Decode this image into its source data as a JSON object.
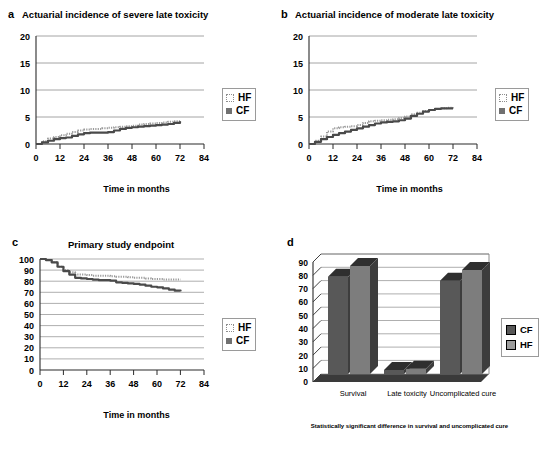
{
  "figure": {
    "panels": [
      "a",
      "b",
      "c",
      "d"
    ]
  },
  "panel_a": {
    "letter": "a",
    "title": "Actuarial incidence of severe late toxicity",
    "xlabel": "Time in months",
    "legend": [
      {
        "label": "HF",
        "marker": "dotted-square"
      },
      {
        "label": "CF",
        "marker": "filled-dot"
      }
    ]
  },
  "panel_b": {
    "letter": "b",
    "title": "Actuarial incidence of moderate late toxicity",
    "xlabel": "Time in months",
    "legend": [
      {
        "label": "HF",
        "marker": "dotted-square"
      },
      {
        "label": "CF",
        "marker": "filled-dot"
      }
    ]
  },
  "panel_c": {
    "letter": "c",
    "title": "Primary study endpoint",
    "xlabel": "Time in months",
    "legend": [
      {
        "label": "HF",
        "marker": "dotted-square"
      },
      {
        "label": "CF",
        "marker": "filled-dot"
      }
    ]
  },
  "panel_d": {
    "letter": "d",
    "caption": "Statistically significant difference in survival and uncomplicated cure",
    "legend": [
      {
        "label": "CF",
        "color": "#585858"
      },
      {
        "label": "HF",
        "color": "#7d7d7d"
      }
    ]
  },
  "chart_data": [
    {
      "type": "line",
      "panel": "a",
      "title": "Actuarial incidence of severe late toxicity",
      "xlabel": "Time in months",
      "ylabel": "",
      "xlim": [
        0,
        84
      ],
      "ylim": [
        0,
        20
      ],
      "xticks": [
        0,
        12,
        24,
        36,
        48,
        60,
        72,
        84
      ],
      "yticks": [
        0,
        5,
        10,
        15,
        20
      ],
      "grid": true,
      "legend_position": "right",
      "series": [
        {
          "name": "HF",
          "color": "#9a9a9a",
          "x": [
            0,
            3,
            6,
            9,
            12,
            15,
            18,
            21,
            24,
            27,
            30,
            33,
            36,
            39,
            42,
            45,
            48,
            51,
            54,
            57,
            60,
            63,
            66,
            69,
            72
          ],
          "values": [
            0,
            0.5,
            1.0,
            1.3,
            1.6,
            1.9,
            2.2,
            2.5,
            2.7,
            2.8,
            2.8,
            2.9,
            3.0,
            3.1,
            3.2,
            3.3,
            3.4,
            3.6,
            3.7,
            3.8,
            3.9,
            4.0,
            4.1,
            4.2,
            4.4
          ]
        },
        {
          "name": "CF",
          "color": "#4a4a4a",
          "x": [
            0,
            3,
            6,
            9,
            12,
            15,
            18,
            21,
            24,
            27,
            30,
            33,
            36,
            39,
            42,
            45,
            48,
            51,
            54,
            57,
            60,
            63,
            66,
            69,
            72
          ],
          "values": [
            0,
            0.3,
            0.6,
            0.9,
            1.1,
            1.2,
            1.5,
            1.8,
            2.0,
            2.1,
            2.1,
            2.1,
            2.2,
            2.5,
            2.8,
            3.0,
            3.1,
            3.2,
            3.3,
            3.4,
            3.5,
            3.6,
            3.7,
            3.9,
            4.2
          ]
        }
      ]
    },
    {
      "type": "line",
      "panel": "b",
      "title": "Actuarial incidence of moderate late toxicity",
      "xlabel": "Time in months",
      "ylabel": "",
      "xlim": [
        0,
        84
      ],
      "ylim": [
        0,
        20
      ],
      "xticks": [
        0,
        12,
        24,
        36,
        48,
        60,
        72,
        84
      ],
      "yticks": [
        0,
        5,
        10,
        15,
        20
      ],
      "grid": true,
      "legend_position": "right",
      "series": [
        {
          "name": "HF",
          "color": "#9a9a9a",
          "x": [
            0,
            3,
            6,
            9,
            12,
            15,
            18,
            21,
            24,
            27,
            30,
            33,
            36,
            39,
            42,
            45,
            48,
            51,
            54,
            57,
            60,
            63,
            66,
            69,
            72
          ],
          "values": [
            0,
            0.6,
            1.4,
            2.3,
            2.9,
            3.1,
            3.2,
            3.3,
            3.5,
            3.9,
            4.2,
            4.3,
            4.4,
            4.5,
            4.6,
            4.8,
            5.1,
            5.5,
            5.8,
            6.1,
            6.3,
            6.5,
            6.6,
            6.7,
            6.8
          ]
        },
        {
          "name": "CF",
          "color": "#4a4a4a",
          "x": [
            0,
            3,
            6,
            9,
            12,
            15,
            18,
            21,
            24,
            27,
            30,
            33,
            36,
            39,
            42,
            45,
            48,
            51,
            54,
            57,
            60,
            63,
            66,
            69,
            72
          ],
          "values": [
            0,
            0.4,
            0.9,
            1.3,
            1.7,
            2.0,
            2.3,
            2.6,
            2.9,
            3.2,
            3.5,
            3.8,
            4.0,
            4.1,
            4.2,
            4.4,
            4.7,
            5.2,
            5.6,
            6.0,
            6.3,
            6.5,
            6.6,
            6.6,
            6.6
          ]
        }
      ]
    },
    {
      "type": "line",
      "panel": "c",
      "title": "Primary study endpoint",
      "xlabel": "Time in months",
      "ylabel": "",
      "xlim": [
        0,
        84
      ],
      "ylim": [
        0,
        100
      ],
      "xticks": [
        0,
        12,
        24,
        36,
        48,
        60,
        72,
        84
      ],
      "yticks": [
        0,
        10,
        20,
        30,
        40,
        50,
        60,
        70,
        80,
        90,
        100
      ],
      "grid": true,
      "legend_position": "right",
      "series": [
        {
          "name": "HF",
          "color": "#9a9a9a",
          "x": [
            0,
            3,
            6,
            9,
            12,
            15,
            18,
            21,
            24,
            27,
            30,
            33,
            36,
            39,
            42,
            45,
            48,
            51,
            54,
            57,
            60,
            63,
            66,
            69,
            72
          ],
          "values": [
            100,
            99,
            97,
            93,
            90,
            88,
            86,
            86,
            85.5,
            85,
            85,
            85,
            84.5,
            84,
            84,
            83.5,
            83,
            83,
            82.5,
            82,
            82,
            81.5,
            81.5,
            81.5,
            81.5
          ]
        },
        {
          "name": "CF",
          "color": "#4a4a4a",
          "x": [
            0,
            3,
            6,
            9,
            12,
            15,
            18,
            21,
            24,
            27,
            30,
            33,
            36,
            39,
            42,
            45,
            48,
            51,
            54,
            57,
            60,
            63,
            66,
            69,
            72
          ],
          "values": [
            100,
            99,
            97,
            93,
            89,
            86,
            83,
            82.5,
            82,
            81.5,
            81,
            81,
            80.5,
            79,
            78.5,
            78,
            77.5,
            77,
            76,
            75,
            74.5,
            73.5,
            72.5,
            71.5,
            71
          ]
        }
      ]
    },
    {
      "type": "bar",
      "panel": "d",
      "title": "",
      "categories": [
        "Survival",
        "Late toxicity",
        "Uncomplicated cure"
      ],
      "xlabel": "",
      "ylabel": "",
      "ylim": [
        0,
        90
      ],
      "yticks": [
        0,
        10,
        20,
        30,
        40,
        50,
        60,
        70,
        80,
        90
      ],
      "grid": true,
      "legend_position": "right",
      "annotation": "Statistically significant difference in survival and uncomplicated cure",
      "series": [
        {
          "name": "CF",
          "color": "#585858",
          "values": [
            73,
            3,
            70
          ]
        },
        {
          "name": "HF",
          "color": "#7d7d7d",
          "values": [
            81,
            4,
            78
          ]
        }
      ]
    }
  ]
}
